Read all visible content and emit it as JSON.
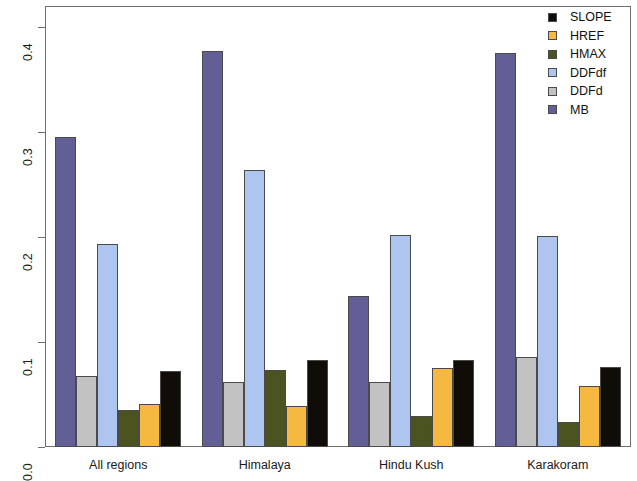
{
  "chart_data": {
    "type": "bar",
    "title": "",
    "xlabel": "",
    "ylabel": "",
    "grid": false,
    "legend_position": "top-right",
    "ylim": [
      0.0,
      0.42
    ],
    "ytick_values": [
      0.0,
      0.1,
      0.2,
      0.3,
      0.4
    ],
    "ytick_labels": [
      "0.0",
      "0.1",
      "0.2",
      "0.3",
      "0.4"
    ],
    "categories": [
      "All regions",
      "Himalaya",
      "Hindu Kush",
      "Karakoram"
    ],
    "bar_order": [
      "MB",
      "DDFd",
      "DDFdf",
      "HMAX",
      "HREF",
      "SLOPE"
    ],
    "series": [
      {
        "name": "SLOPE",
        "color": "#100c08",
        "values": [
          0.072,
          0.083,
          0.083,
          0.076
        ]
      },
      {
        "name": "HREF",
        "color": "#f5b942",
        "values": [
          0.041,
          0.039,
          0.075,
          0.058
        ]
      },
      {
        "name": "HMAX",
        "color": "#4b5320",
        "values": [
          0.035,
          0.073,
          0.03,
          0.024
        ]
      },
      {
        "name": "DDFdf",
        "color": "#aec6ef",
        "values": [
          0.193,
          0.264,
          0.202,
          0.201
        ]
      },
      {
        "name": "DDFd",
        "color": "#c2c2c2",
        "values": [
          0.068,
          0.062,
          0.062,
          0.086
        ]
      },
      {
        "name": "MB",
        "color": "#625f96",
        "values": [
          0.295,
          0.377,
          0.144,
          0.375
        ]
      }
    ]
  },
  "legend": {
    "entries": [
      {
        "label": "SLOPE",
        "color": "#100c08"
      },
      {
        "label": "HREF",
        "color": "#f5b942"
      },
      {
        "label": "HMAX",
        "color": "#4b5320"
      },
      {
        "label": "DDFdf",
        "color": "#aec6ef"
      },
      {
        "label": "DDFd",
        "color": "#c2c2c2"
      },
      {
        "label": "MB",
        "color": "#625f96"
      }
    ]
  },
  "axes": {
    "frame_color": "#6e6e6e",
    "tick_color": "#6e6e6e",
    "text_color": "#1a1a1a"
  }
}
